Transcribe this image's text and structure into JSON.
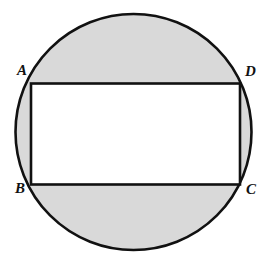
{
  "figure": {
    "background_color": "#ffffff",
    "stroke_color": "#111111",
    "shaded_fill_color": "#d9d9d9",
    "rectangle_fill_color": "#ffffff",
    "circle": {
      "name": "circle",
      "center_x": 133.5,
      "center_y": 132,
      "radius": 118,
      "stroke_width": 2.6,
      "fill": "#d9d9d9",
      "stroke": "#111111"
    },
    "rectangle": {
      "name": "rectangle-ABCD",
      "x": 31,
      "y": 83.5,
      "width": 209,
      "height": 101,
      "stroke_width": 2.6,
      "fill": "#ffffff",
      "stroke": "#111111"
    },
    "vertices": [
      {
        "id": "A",
        "label": "A",
        "position": "top-left",
        "x": 31,
        "y": 83.5,
        "label_x": 17,
        "label_y": 63
      },
      {
        "id": "D",
        "label": "D",
        "position": "top-right",
        "x": 240,
        "y": 83.5,
        "label_x": 245,
        "label_y": 64
      },
      {
        "id": "B",
        "label": "B",
        "position": "bottom-left",
        "x": 31,
        "y": 184.5,
        "label_x": 15,
        "label_y": 181
      },
      {
        "id": "C",
        "label": "C",
        "position": "bottom-right",
        "x": 240,
        "y": 184.5,
        "label_x": 246,
        "label_y": 182
      }
    ],
    "shaded_regions": [
      {
        "name": "upper-circular-segment",
        "description": "region of circle above segment AD"
      },
      {
        "name": "lower-circular-segment",
        "description": "region of circle below segment BC"
      },
      {
        "name": "left-circular-segment",
        "description": "region of circle left of segment AB"
      },
      {
        "name": "right-circular-segment",
        "description": "region of circle right of segment DC"
      }
    ]
  }
}
